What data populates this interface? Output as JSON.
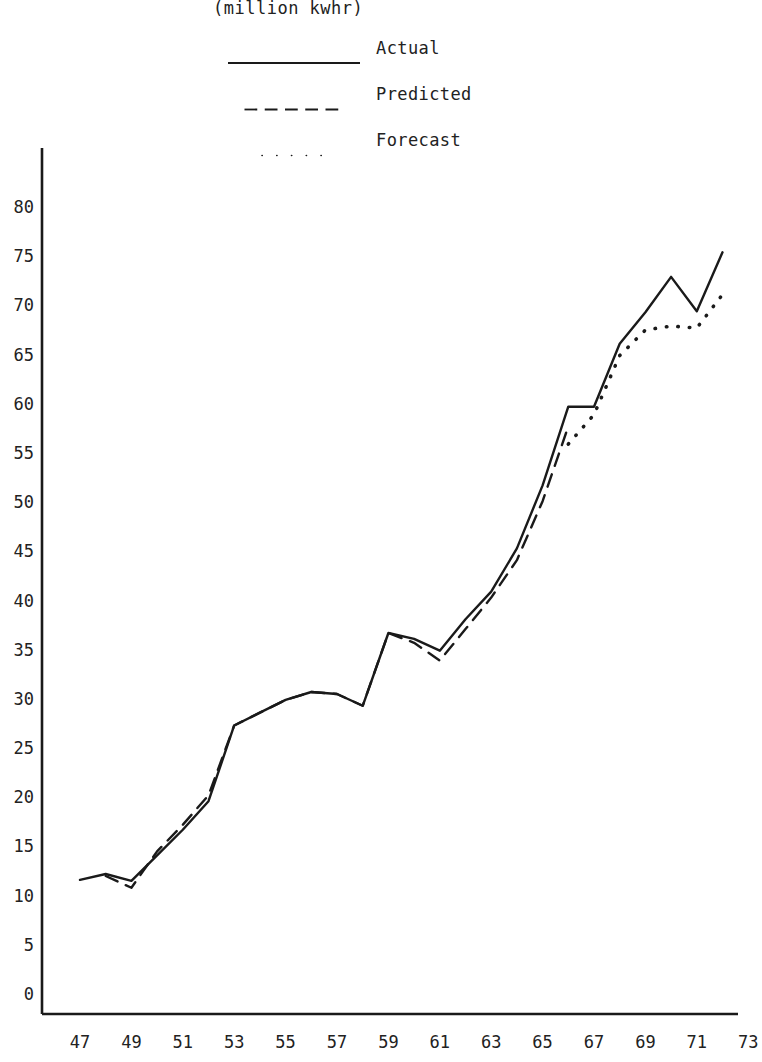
{
  "figure": {
    "subtitle": "(million kwhr)"
  },
  "legend": {
    "position": "top-center",
    "entries": [
      {
        "label": "Actual",
        "style": "solid"
      },
      {
        "label": "Predicted",
        "style": "dashed"
      },
      {
        "label": "Forecast",
        "style": "dotted"
      }
    ]
  },
  "chart_data": {
    "type": "line",
    "title": "",
    "subtitle": "(million kwhr)",
    "xlabel": "",
    "ylabel": "",
    "xlim": [
      46,
      73.5
    ],
    "ylim": [
      0,
      83
    ],
    "grid": false,
    "x_tick_labels": [
      "47",
      "49",
      "51",
      "53",
      "55",
      "57",
      "59",
      "61",
      "63",
      "65",
      "67",
      "69",
      "71",
      "73"
    ],
    "x_tick_values": [
      47,
      49,
      51,
      53,
      55,
      57,
      59,
      61,
      63,
      65,
      67,
      69,
      71,
      73
    ],
    "y_tick_labels": [
      "0",
      "5",
      "10",
      "15",
      "20",
      "25",
      "30",
      "35",
      "40",
      "45",
      "50",
      "55",
      "60",
      "65",
      "70",
      "75",
      "80"
    ],
    "y_tick_values": [
      0,
      5,
      10,
      15,
      20,
      25,
      30,
      35,
      40,
      45,
      50,
      55,
      60,
      65,
      70,
      75,
      80
    ],
    "series": [
      {
        "name": "Actual",
        "style": "solid",
        "x": [
          47,
          48,
          49,
          50,
          51,
          52,
          53,
          54,
          55,
          56,
          57,
          58,
          59,
          60,
          61,
          62,
          63,
          64,
          65,
          66,
          67,
          68,
          69,
          70,
          71,
          72
        ],
        "values": [
          11.7,
          12.3,
          11.6,
          14.2,
          16.8,
          19.7,
          27.4,
          28.7,
          30.0,
          30.8,
          30.6,
          29.4,
          36.8,
          36.2,
          35.0,
          38.2,
          41.0,
          45.4,
          51.8,
          59.8,
          59.8,
          66.2,
          69.4,
          73.0,
          69.5,
          75.5
        ]
      },
      {
        "name": "Predicted",
        "style": "dashed",
        "x": [
          48,
          49,
          50,
          51,
          52,
          53,
          54,
          55,
          56,
          57,
          58,
          59,
          60,
          61,
          62,
          63,
          64,
          65,
          66
        ],
        "values": [
          12.1,
          10.9,
          14.6,
          17.3,
          20.3,
          27.4,
          28.7,
          30.0,
          30.8,
          30.6,
          29.4,
          36.8,
          35.8,
          34.0,
          37.2,
          40.4,
          44.2,
          50.2,
          57.8
        ]
      },
      {
        "name": "Forecast",
        "style": "dotted",
        "x": [
          66,
          67,
          68,
          69,
          70,
          71,
          72
        ],
        "values": [
          56.0,
          59.0,
          65.0,
          67.6,
          68.0,
          67.8,
          71.2
        ]
      }
    ]
  },
  "colors": {
    "ink": "#1a1a1a",
    "paper": "#ffffff"
  }
}
